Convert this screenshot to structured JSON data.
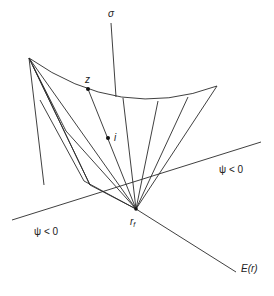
{
  "diagram": {
    "labels": {
      "sigma_axis": "σ",
      "point_z": "z",
      "point_i": "i",
      "apex": "r",
      "apex_sub": "f",
      "energy_axis": "E(r)",
      "region_right": "ψ < 0",
      "region_left": "ψ < 0"
    },
    "colors": {
      "line": "#2a2a2a",
      "background": "#ffffff"
    }
  }
}
